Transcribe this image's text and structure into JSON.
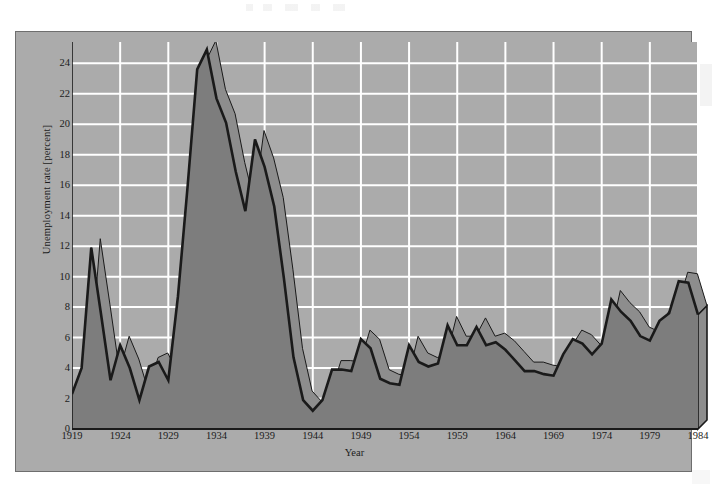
{
  "figure": {
    "background_color": "#ababab",
    "frame_border_color": "#6e6e6e",
    "page_color": "#ffffff"
  },
  "chart_data": {
    "type": "area",
    "title": "",
    "xlabel": "Year",
    "ylabel": "Unemployment rate [percent]",
    "xlim": [
      1919,
      1984
    ],
    "ylim": [
      0,
      25.4
    ],
    "grid": true,
    "legend": null,
    "plot_area_color": "#ababab",
    "gridline_color": "#ffffff",
    "fill_color": "#7d7d7d",
    "line_color": "#1a1a1a",
    "shadow_color": "#8d8d8d",
    "ytick_values": [
      0,
      2,
      4,
      6,
      8,
      10,
      12,
      14,
      16,
      18,
      20,
      22,
      24
    ],
    "ytick_labels": [
      "0",
      "2",
      "4",
      "6",
      "8",
      "10",
      "12",
      "14",
      "16",
      "18",
      "20",
      "22",
      "24"
    ],
    "xtick_values": [
      1919,
      1924,
      1929,
      1934,
      1939,
      1944,
      1949,
      1954,
      1959,
      1964,
      1969,
      1974,
      1979,
      1984
    ],
    "xtick_labels": [
      "1919",
      "1924",
      "1929",
      "1934",
      "1939",
      "1944",
      "1949",
      "1954",
      "1959",
      "1964",
      "1969",
      "1974",
      "1979",
      "1984"
    ],
    "x": [
      1919,
      1920,
      1921,
      1922,
      1923,
      1924,
      1925,
      1926,
      1927,
      1928,
      1929,
      1930,
      1931,
      1932,
      1933,
      1934,
      1935,
      1936,
      1937,
      1938,
      1939,
      1940,
      1941,
      1942,
      1943,
      1944,
      1945,
      1946,
      1947,
      1948,
      1949,
      1950,
      1951,
      1952,
      1953,
      1954,
      1955,
      1956,
      1957,
      1958,
      1959,
      1960,
      1961,
      1962,
      1963,
      1964,
      1965,
      1966,
      1967,
      1968,
      1969,
      1970,
      1971,
      1972,
      1973,
      1974,
      1975,
      1976,
      1977,
      1978,
      1979,
      1980,
      1981,
      1982,
      1983,
      1984
    ],
    "values": [
      2.3,
      4.0,
      11.9,
      7.6,
      3.2,
      5.5,
      4.0,
      1.9,
      4.1,
      4.4,
      3.2,
      8.7,
      15.9,
      23.6,
      24.9,
      21.7,
      20.1,
      16.9,
      14.3,
      19.0,
      17.2,
      14.6,
      9.9,
      4.7,
      1.9,
      1.2,
      1.9,
      3.9,
      3.9,
      3.8,
      5.9,
      5.3,
      3.3,
      3.0,
      2.9,
      5.5,
      4.4,
      4.1,
      4.3,
      6.8,
      5.5,
      5.5,
      6.7,
      5.5,
      5.7,
      5.2,
      4.5,
      3.8,
      3.8,
      3.6,
      3.5,
      4.9,
      5.9,
      5.6,
      4.9,
      5.6,
      8.5,
      7.7,
      7.1,
      6.1,
      5.8,
      7.1,
      7.6,
      9.7,
      9.6,
      7.5
    ],
    "peak_annotation": {
      "year": 1933,
      "value": 24.9
    },
    "min_annotation": {
      "year": 1944,
      "value": 1.2
    }
  }
}
